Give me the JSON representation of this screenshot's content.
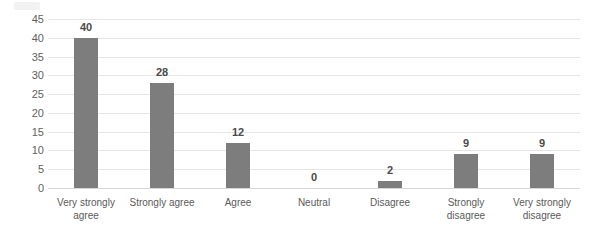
{
  "chart_data": {
    "type": "bar",
    "title": "",
    "subtitle": "",
    "xlabel": "",
    "ylabel": "",
    "categories": [
      "Very strongly agree",
      "Strongly agree",
      "Agree",
      "Neutral",
      "Disagree",
      "Strongly disagree",
      "Very strongly disagree"
    ],
    "values": [
      40,
      28,
      12,
      0,
      2,
      9,
      9
    ],
    "data_labels": [
      "40",
      "28",
      "12",
      "0",
      "2",
      "9",
      "9"
    ],
    "ylim": [
      0,
      45
    ],
    "y_ticks": [
      0,
      5,
      10,
      15,
      20,
      25,
      30,
      35,
      40,
      45
    ],
    "y_tick_labels": [
      "0",
      "5",
      "10",
      "15",
      "20",
      "25",
      "30",
      "35",
      "40",
      "45"
    ],
    "grid": true,
    "grid_axis": "y",
    "legend": false,
    "legend_position": "none",
    "series": [
      {
        "name": "Responses",
        "values": [
          40,
          28,
          12,
          0,
          2,
          9,
          9
        ]
      }
    ]
  },
  "style": {
    "bar_color": "#7d7d7d",
    "gridline_color": "#e6e6e6",
    "baseline_color": "#d8d8d8",
    "background_color": "#ffffff",
    "label_color": "#4a4a4a",
    "tick_color": "#5f5f5f"
  }
}
